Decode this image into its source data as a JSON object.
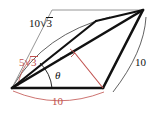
{
  "figure": {
    "type": "geometry-diagram",
    "background_color": "#ffffff",
    "stroke_color": "#111111",
    "accent_color": "#c0504d",
    "labels": {
      "diagonal": {
        "coefficient": "10",
        "radicand": "3",
        "text": "10√3",
        "color": "#111111"
      },
      "height": {
        "coefficient": "5",
        "radicand": "3",
        "text": "5√3",
        "color": "#c0504d"
      },
      "side_right": {
        "text": "10",
        "color": "#111111"
      },
      "base_bottom": {
        "text": "10",
        "color": "#c0504d"
      },
      "angle": {
        "text": "θ",
        "color": "#111111"
      }
    },
    "vertices": {
      "lower_left": {
        "x": 12,
        "y": 88
      },
      "lower_right": {
        "x": 103,
        "y": 88
      },
      "upper_right": {
        "x": 143,
        "y": 10
      },
      "upper_left": {
        "x": 52,
        "y": 10
      }
    },
    "angle_arc": {
      "label": "θ",
      "at_vertex": "lower_left"
    },
    "right_angle_mark": {
      "color": "#c0504d",
      "at": "foot of height on diagonal"
    }
  }
}
